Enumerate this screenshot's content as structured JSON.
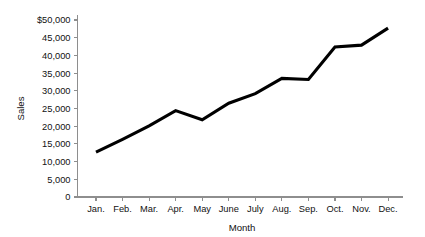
{
  "chart_data": {
    "type": "line",
    "title": "",
    "xlabel": "Month",
    "ylabel": "Sales",
    "categories": [
      "Jan.",
      "Feb.",
      "Mar.",
      "Apr.",
      "May",
      "June",
      "July",
      "Aug.",
      "Sep.",
      "Oct.",
      "Nov.",
      "Dec."
    ],
    "values": [
      12700,
      16300,
      20100,
      24400,
      21800,
      26500,
      29200,
      33500,
      33200,
      42400,
      42900,
      47700
    ],
    "series": [
      {
        "name": "Sales",
        "values": [
          12700,
          16300,
          20100,
          24400,
          21800,
          26500,
          29200,
          33500,
          33200,
          42400,
          42900,
          47700
        ]
      }
    ],
    "ylim": [
      0,
      50000
    ],
    "ytick_values": [
      0,
      5000,
      10000,
      15000,
      20000,
      25000,
      30000,
      35000,
      40000,
      45000,
      50000
    ],
    "ytick_labels": [
      "0",
      "5,000",
      "10,000",
      "15,000",
      "20,000",
      "25,000",
      "30,000",
      "35,000",
      "40,000",
      "45,000",
      "$50,000"
    ],
    "grid": false,
    "legend": false,
    "markers": false,
    "line_color": "#000000",
    "axis_color": "#8e8e8e",
    "background_color": "#ffffff"
  }
}
